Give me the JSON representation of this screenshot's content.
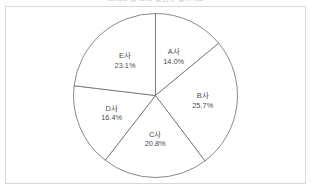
{
  "header": {
    "clipped_title": "그래프 를 보고 물음에 답하시오"
  },
  "chart_data": {
    "type": "pie",
    "title": "",
    "subtitle": "",
    "xlabel": "",
    "ylabel": "",
    "legend": "none",
    "grid": false,
    "start_angle_deg": 0,
    "direction": "clockwise",
    "units": "percent",
    "total": "100.0%",
    "categories": [
      "A사",
      "B사",
      "C사",
      "D사",
      "E사"
    ],
    "values": [
      14.0,
      25.7,
      20.8,
      16.4,
      23.1
    ],
    "slices": [
      {
        "name": "A사",
        "value": 14.0,
        "label": "A사",
        "percent_label": "14.0%"
      },
      {
        "name": "B사",
        "value": 25.7,
        "label": "B사",
        "percent_label": "25.7%"
      },
      {
        "name": "C사",
        "value": 20.8,
        "label": "C사",
        "percent_label": "20.8%"
      },
      {
        "name": "D사",
        "value": 16.4,
        "label": "D사",
        "percent_label": "16.4%"
      },
      {
        "name": "E사",
        "value": 23.1,
        "label": "E사",
        "percent_label": "23.1%"
      }
    ],
    "colors": {
      "slice_fill": "#ffffff",
      "slice_stroke": "#6b6b70",
      "label_text": "#4a4a4f",
      "frame_border": "#d8d8dc",
      "background": "#ffffff"
    }
  }
}
